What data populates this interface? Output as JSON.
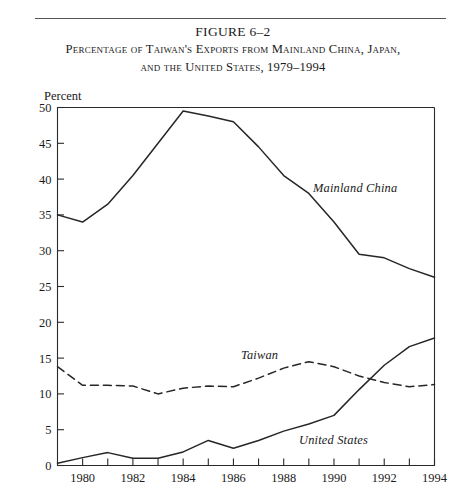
{
  "figure": {
    "number": "FIGURE 6–2",
    "title_line1": "Percentage of Taiwan's Exports from Mainland China, Japan,",
    "title_line2": "and the United States, 1979–1994"
  },
  "axis": {
    "y_label": "Percent"
  },
  "series_labels": {
    "mainland_china": "Mainland China",
    "taiwan": "Taiwan",
    "united_states": "United States"
  },
  "chart_data": {
    "type": "line",
    "title": "Percentage of Taiwan's Exports from Mainland China, Japan, and the United States, 1979–1994",
    "xlabel": "",
    "ylabel": "Percent",
    "xlim": [
      1979,
      1994
    ],
    "ylim": [
      0,
      50
    ],
    "yticks": [
      0,
      5,
      10,
      15,
      20,
      25,
      30,
      35,
      40,
      45,
      50
    ],
    "xticks": [
      1979,
      1980,
      1981,
      1982,
      1983,
      1984,
      1985,
      1986,
      1987,
      1988,
      1989,
      1990,
      1991,
      1992,
      1993,
      1994
    ],
    "xticklabels": [
      "",
      "1980",
      "",
      "1982",
      "",
      "1984",
      "",
      "1986",
      "",
      "1988",
      "",
      "1990",
      "",
      "1992",
      "",
      "1994"
    ],
    "grid": false,
    "legend": "inline-annotations",
    "x": [
      1979,
      1980,
      1981,
      1982,
      1983,
      1984,
      1985,
      1986,
      1987,
      1988,
      1989,
      1990,
      1991,
      1992,
      1993,
      1994
    ],
    "series": [
      {
        "name": "Mainland China",
        "style": "solid",
        "color": "#262626",
        "values": [
          35.0,
          34.0,
          36.5,
          40.5,
          45.0,
          49.5,
          48.8,
          48.0,
          44.5,
          40.5,
          38.0,
          34.0,
          29.5,
          29.0,
          27.5,
          26.3
        ]
      },
      {
        "name": "Taiwan",
        "style": "dashed",
        "color": "#262626",
        "values": [
          13.8,
          11.2,
          11.2,
          11.1,
          10.0,
          10.8,
          11.1,
          11.0,
          12.2,
          13.6,
          14.5,
          13.8,
          12.5,
          11.6,
          11.0,
          11.3
        ]
      },
      {
        "name": "United States",
        "style": "solid",
        "color": "#262626",
        "values": [
          0.3,
          1.1,
          1.8,
          1.0,
          1.0,
          1.9,
          3.5,
          2.4,
          3.5,
          4.8,
          5.8,
          7.0,
          10.6,
          14.0,
          16.6,
          17.8
        ]
      }
    ]
  }
}
